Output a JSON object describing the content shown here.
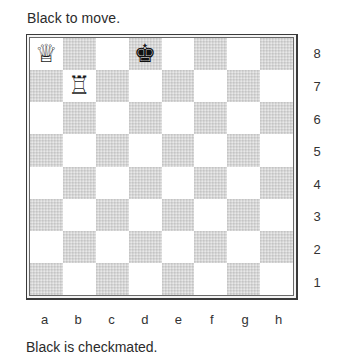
{
  "header": {
    "turn_text": "Black to move."
  },
  "footer": {
    "status_text": "Black is checkmated."
  },
  "board": {
    "files": [
      "a",
      "b",
      "c",
      "d",
      "e",
      "f",
      "g",
      "h"
    ],
    "ranks": [
      "8",
      "7",
      "6",
      "5",
      "4",
      "3",
      "2",
      "1"
    ],
    "light_square_color": "#ffffff",
    "dark_square_color": "#d6d6d6",
    "pieces": [
      {
        "square": "a8",
        "color": "white",
        "type": "queen",
        "glyph": "♕"
      },
      {
        "square": "d8",
        "color": "black",
        "type": "king",
        "glyph": "♚"
      },
      {
        "square": "b7",
        "color": "white",
        "type": "rook",
        "glyph": "♖"
      }
    ]
  }
}
